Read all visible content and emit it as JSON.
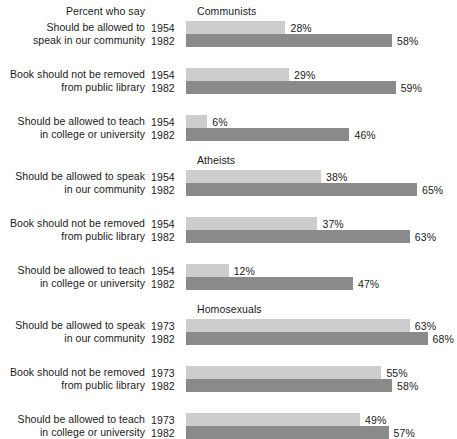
{
  "header": {
    "note": "Percent who say"
  },
  "colors": {
    "early_bar": "#cdcdcd",
    "late_bar": "#8a8a8a",
    "text": "#1a1a1a",
    "background": "#ffffff"
  },
  "chart_data": {
    "type": "bar",
    "orientation": "horizontal",
    "title": "Percent who say",
    "xlabel": "",
    "ylabel": "",
    "xlim": [
      0,
      70
    ],
    "grid": false,
    "legend": "none",
    "value_suffix": "%",
    "groups": [
      {
        "name": "Communists",
        "rows": [
          {
            "label_line1": "Should be allowed to",
            "label_line2": "speak in our community",
            "bars": [
              {
                "year": "1954",
                "value": 28,
                "value_label": "28%",
                "shade": "early"
              },
              {
                "year": "1982",
                "value": 58,
                "value_label": "58%",
                "shade": "late"
              }
            ]
          },
          {
            "label_line1": "Book should not be removed",
            "label_line2": "from public library",
            "bars": [
              {
                "year": "1954",
                "value": 29,
                "value_label": "29%",
                "shade": "early"
              },
              {
                "year": "1982",
                "value": 59,
                "value_label": "59%",
                "shade": "late"
              }
            ]
          },
          {
            "label_line1": "Should be allowed to teach",
            "label_line2": "in college or university",
            "bars": [
              {
                "year": "1954",
                "value": 6,
                "value_label": "6%",
                "shade": "early"
              },
              {
                "year": "1982",
                "value": 46,
                "value_label": "46%",
                "shade": "late"
              }
            ]
          }
        ]
      },
      {
        "name": "Atheists",
        "rows": [
          {
            "label_line1": "Should be allowed to speak",
            "label_line2": "in our community",
            "bars": [
              {
                "year": "1954",
                "value": 38,
                "value_label": "38%",
                "shade": "early"
              },
              {
                "year": "1982",
                "value": 65,
                "value_label": "65%",
                "shade": "late"
              }
            ]
          },
          {
            "label_line1": "Book should not be removed",
            "label_line2": "from public library",
            "bars": [
              {
                "year": "1954",
                "value": 37,
                "value_label": "37%",
                "shade": "early"
              },
              {
                "year": "1982",
                "value": 63,
                "value_label": "63%",
                "shade": "late"
              }
            ]
          },
          {
            "label_line1": "Should be allowed to teach",
            "label_line2": "in college or university",
            "bars": [
              {
                "year": "1954",
                "value": 12,
                "value_label": "12%",
                "shade": "early"
              },
              {
                "year": "1982",
                "value": 47,
                "value_label": "47%",
                "shade": "late"
              }
            ]
          }
        ]
      },
      {
        "name": "Homosexuals",
        "rows": [
          {
            "label_line1": "Should be allowed to speak",
            "label_line2": "in our community",
            "bars": [
              {
                "year": "1973",
                "value": 63,
                "value_label": "63%",
                "shade": "early"
              },
              {
                "year": "1982",
                "value": 68,
                "value_label": "68%",
                "shade": "late"
              }
            ]
          },
          {
            "label_line1": "Book should not be removed",
            "label_line2": "from public library",
            "bars": [
              {
                "year": "1973",
                "value": 55,
                "value_label": "55%",
                "shade": "early"
              },
              {
                "year": "1982",
                "value": 58,
                "value_label": "58%",
                "shade": "late"
              }
            ]
          },
          {
            "label_line1": "Should be allowed to teach",
            "label_line2": "in college or university",
            "bars": [
              {
                "year": "1973",
                "value": 49,
                "value_label": "49%",
                "shade": "early"
              },
              {
                "year": "1982",
                "value": 57,
                "value_label": "57%",
                "shade": "late"
              }
            ]
          }
        ]
      }
    ]
  }
}
